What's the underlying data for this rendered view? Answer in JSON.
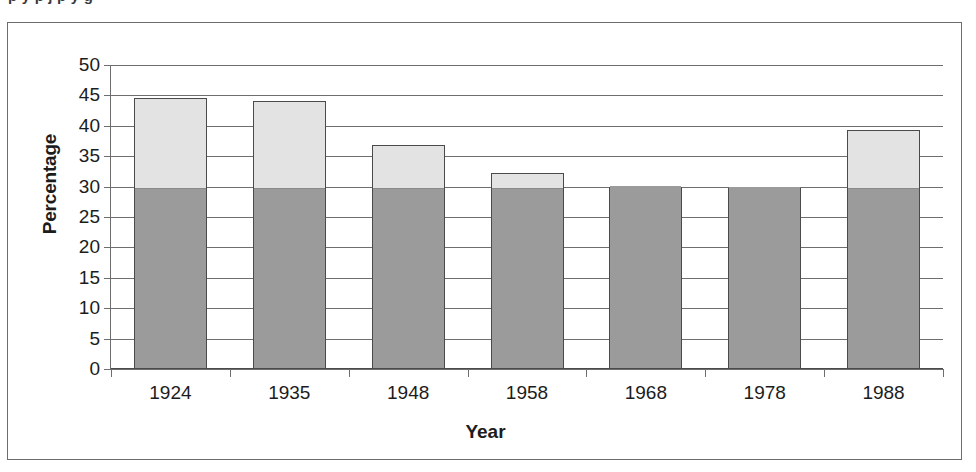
{
  "caption_remnant": "descender remnants of cut-off caption line",
  "figure": {
    "y_axis_title": "Percentage",
    "x_axis_title": "Year"
  },
  "chart_data": {
    "type": "bar",
    "title": "",
    "subtitle": "",
    "xlabel": "Year",
    "ylabel": "Percentage",
    "categories": [
      "1924",
      "1935",
      "1948",
      "1958",
      "1968",
      "1978",
      "1988"
    ],
    "ylim": [
      0,
      50
    ],
    "ytick_labels": [
      "0",
      "5",
      "10",
      "15",
      "20",
      "25",
      "30",
      "35",
      "40",
      "45",
      "50"
    ],
    "ytick_values": [
      0,
      5,
      10,
      15,
      20,
      25,
      30,
      35,
      40,
      45,
      50
    ],
    "grid": true,
    "grid_axis": "y",
    "legend": "none",
    "stacked": true,
    "values": [
      44.6,
      44.0,
      36.8,
      32.3,
      30.0,
      29.7,
      39.3
    ],
    "series": [
      {
        "name": "lower-segment",
        "color": "#9b9b9b",
        "values": [
          30.0,
          30.0,
          30.0,
          30.0,
          30.0,
          29.7,
          30.0
        ]
      },
      {
        "name": "upper-segment",
        "color": "#e3e3e3",
        "values": [
          14.6,
          14.0,
          6.8,
          2.3,
          0.0,
          0.0,
          9.3
        ]
      }
    ],
    "colors": {
      "lower_segment": "#9b9b9b",
      "upper_segment": "#e3e3e3",
      "bar_outline": "#4a4a4a",
      "gridline": "#6e6e6e",
      "frame": "#6d6d6d",
      "text": "#1c1c1c"
    }
  }
}
